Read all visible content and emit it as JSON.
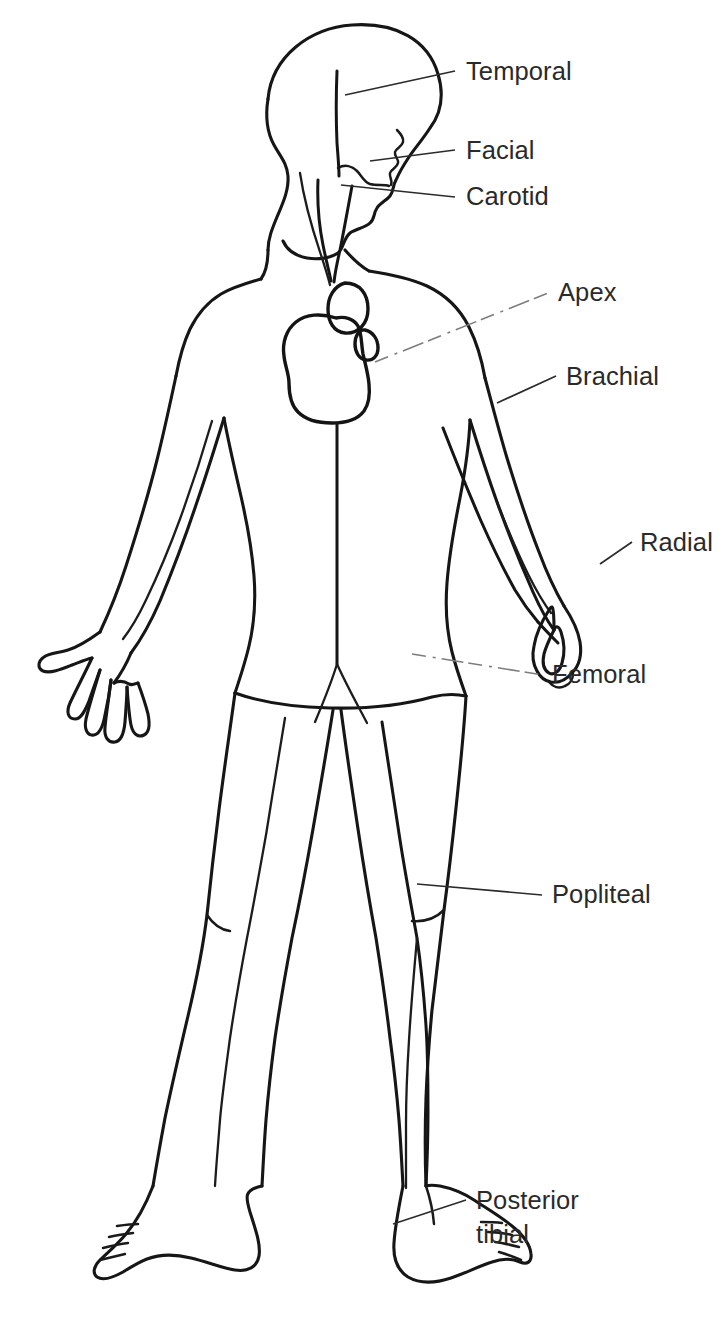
{
  "diagram": {
    "background_color": "#ffffff",
    "line_color": "#161616",
    "label_color": "#2a2a2a",
    "leader_faint_color": "#7d7d7d"
  },
  "labels": [
    {
      "id": "temporal",
      "text": "Temporal",
      "text_x": 466,
      "text_y": 80,
      "leader_style": "solid",
      "leader_from_x": 345,
      "leader_from_y": 95,
      "leader_to_x": 455,
      "leader_to_y": 71
    },
    {
      "id": "facial",
      "text": "Facial",
      "text_x": 466,
      "text_y": 159,
      "leader_style": "solid",
      "leader_from_x": 370,
      "leader_from_y": 161,
      "leader_to_x": 455,
      "leader_to_y": 150
    },
    {
      "id": "carotid",
      "text": "Carotid",
      "text_x": 466,
      "text_y": 205,
      "leader_style": "solid",
      "leader_from_x": 341,
      "leader_from_y": 185,
      "leader_to_x": 455,
      "leader_to_y": 197
    },
    {
      "id": "apex",
      "text": "Apex",
      "text_x": 558,
      "text_y": 301,
      "leader_style": "faint-dashed",
      "leader_from_x": 375,
      "leader_from_y": 362,
      "leader_to_x": 548,
      "leader_to_y": 293
    },
    {
      "id": "brachial",
      "text": "Brachial",
      "text_x": 566,
      "text_y": 385,
      "leader_style": "solid",
      "leader_from_x": 497,
      "leader_from_y": 403,
      "leader_to_x": 556,
      "leader_to_y": 376
    },
    {
      "id": "radial",
      "text": "Radial",
      "text_x": 640,
      "text_y": 551,
      "leader_style": "solid",
      "leader_from_x": 600,
      "leader_from_y": 564,
      "leader_to_x": 632,
      "leader_to_y": 542
    },
    {
      "id": "femoral",
      "text": "Femoral",
      "text_x": 552,
      "text_y": 683,
      "leader_style": "faint-dashed",
      "leader_from_x": 412,
      "leader_from_y": 654,
      "leader_to_x": 543,
      "leader_to_y": 675
    },
    {
      "id": "popliteal",
      "text": "Popliteal",
      "text_x": 552,
      "text_y": 903,
      "leader_style": "solid",
      "leader_from_x": 417,
      "leader_from_y": 884,
      "leader_to_x": 542,
      "leader_to_y": 895
    },
    {
      "id": "posterior-tibial",
      "text": "Posterior",
      "text_x": 476,
      "text_y": 1209,
      "leader_style": "solid",
      "leader_from_x": 393,
      "leader_from_y": 1224,
      "leader_to_x": 466,
      "leader_to_y": 1200
    },
    {
      "id": "posterior-tibial-line2",
      "text": "tibial",
      "text_x": 476,
      "text_y": 1243,
      "leader_style": "none"
    }
  ]
}
